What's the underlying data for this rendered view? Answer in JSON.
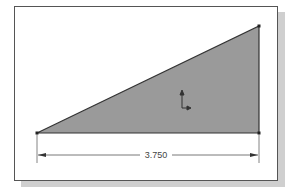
{
  "sketch": {
    "shape": "right-triangle",
    "vertices": [
      [
        37,
        133
      ],
      [
        259,
        26
      ],
      [
        259,
        133
      ]
    ],
    "fill_color": "#9a9a9a",
    "edge_color": "#333333"
  },
  "dimension": {
    "value": "3.750",
    "orientation": "horizontal"
  },
  "origin_marker": {
    "icon": "coordinate-axes-icon"
  }
}
